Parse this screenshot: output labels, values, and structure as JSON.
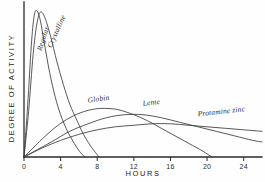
{
  "chart_data": {
    "type": "line",
    "title": "",
    "xlabel": "HOURS",
    "ylabel": "DEGREE OF ACTIVITY",
    "xlim": [
      0,
      26
    ],
    "ylim": [
      0,
      100
    ],
    "xticks": [
      0,
      4,
      8,
      12,
      16,
      20,
      24
    ],
    "xticklabels": [
      "0",
      "4",
      "8",
      "12",
      "16",
      "20",
      "24"
    ],
    "yticks": [],
    "yticklabels": [],
    "grid": false,
    "legend_position": "inline-annotations",
    "series": [
      {
        "name": "Regular",
        "label": "Regular",
        "x": [
          0,
          0.4,
          0.8,
          1.1,
          1.4,
          1.8,
          2.2,
          2.8,
          3.4,
          4.0,
          4.6,
          5.2,
          5.8,
          6.3,
          6.7
        ],
        "y": [
          0,
          34,
          74,
          93,
          97,
          90,
          76,
          56,
          40,
          28,
          19,
          12,
          6,
          2,
          0
        ]
      },
      {
        "name": "Crystalline",
        "label": "Crystalline",
        "x": [
          0,
          0.5,
          1.0,
          1.4,
          1.8,
          2.3,
          2.9,
          3.6,
          4.3,
          5.0,
          5.8,
          6.5,
          7.2,
          7.8,
          8.2
        ],
        "y": [
          0,
          30,
          68,
          88,
          96,
          92,
          80,
          63,
          48,
          35,
          24,
          15,
          8,
          3,
          0
        ]
      },
      {
        "name": "Globin",
        "label": "Globin",
        "x": [
          0,
          1,
          2,
          3.5,
          5,
          6.5,
          8,
          9.5,
          10.5,
          12,
          13.5,
          15,
          16.5,
          18,
          19.5,
          20.5
        ],
        "y": [
          0,
          6,
          12,
          20,
          26,
          30,
          32,
          32,
          31,
          28,
          24,
          19,
          14,
          9,
          4,
          0
        ]
      },
      {
        "name": "Lente",
        "label": "Lente",
        "x": [
          0,
          1.5,
          3,
          5,
          7,
          9,
          11,
          13,
          15,
          17,
          19,
          21,
          23,
          25,
          26
        ],
        "y": [
          0,
          5,
          10,
          17,
          22,
          26,
          28,
          28,
          26,
          23,
          20,
          17,
          14,
          11,
          10
        ]
      },
      {
        "name": "Protamine zinc",
        "label": "Protamine zinc",
        "x": [
          0,
          2,
          4,
          6,
          8,
          10,
          12,
          14,
          16,
          18,
          20,
          22,
          24,
          26
        ],
        "y": [
          0,
          6,
          11,
          15,
          18,
          20,
          21,
          22,
          22,
          21,
          20,
          19,
          18,
          17
        ]
      }
    ],
    "annotations": [
      {
        "text": "Regular",
        "x": 1.9,
        "y": 70,
        "rotation": -72
      },
      {
        "text": "Crystalline",
        "x": 3.0,
        "y": 72,
        "rotation": -66
      },
      {
        "text": "Globin",
        "x": 7.0,
        "y": 36,
        "rotation": -8
      },
      {
        "text": "Lente",
        "x": 13.0,
        "y": 34,
        "rotation": -6
      },
      {
        "text": "Protamine zinc",
        "x": 19.0,
        "y": 27,
        "rotation": -6
      }
    ]
  }
}
